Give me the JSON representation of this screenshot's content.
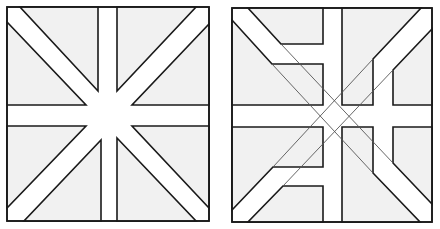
{
  "figure": {
    "colors": {
      "fill": "#f1f1f1",
      "stroke": "#1a1a1a",
      "thin_stroke": "#555555",
      "background": "#ffffff"
    },
    "panels": [
      {
        "id": "left",
        "label": ""
      },
      {
        "id": "right",
        "label": ""
      }
    ]
  }
}
